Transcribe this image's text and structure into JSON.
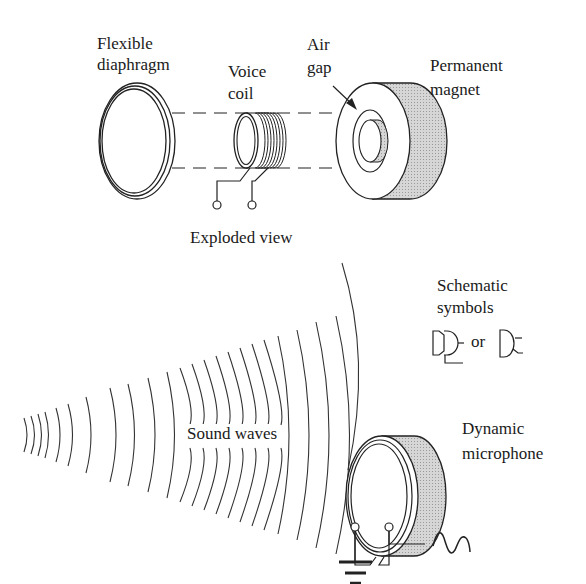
{
  "exploded_view": {
    "caption": "Exploded view",
    "diaphragm_label_1": "Flexible",
    "diaphragm_label_2": "diaphragm",
    "coil_label_1": "Voice",
    "coil_label_2": "coil",
    "airgap_label_1": "Air",
    "airgap_label_2": "gap",
    "magnet_label_1": "Permanent",
    "magnet_label_2": "magnet"
  },
  "schematic": {
    "title_1": "Schematic",
    "title_2": "symbols",
    "or_text": "or"
  },
  "assembled": {
    "sound_label": "Sound waves",
    "mic_label_1": "Dynamic",
    "mic_label_2": "microphone"
  },
  "colors": {
    "line": "#222222",
    "shade": "#c8c8c8",
    "background": "#ffffff"
  }
}
